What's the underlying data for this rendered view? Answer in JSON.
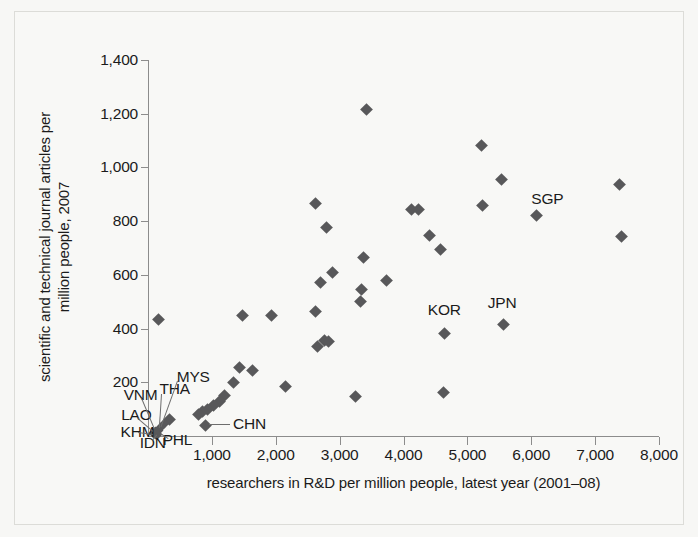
{
  "chart_data": {
    "type": "scatter",
    "title": "",
    "xlabel": "researchers in R&D per million people, latest year (2001–08)",
    "ylabel": "scientific and technical journal articles per million people, 2007",
    "xlim": [
      0,
      8000
    ],
    "ylim": [
      0,
      1400
    ],
    "xticks": [
      1000,
      2000,
      3000,
      4000,
      5000,
      6000,
      7000,
      8000
    ],
    "xticklabels": [
      "1,000",
      "2,000",
      "3,000",
      "4,000",
      "5,000",
      "6,000",
      "7,000",
      "8,000"
    ],
    "yticks": [
      200,
      400,
      600,
      800,
      1000,
      1200,
      1400
    ],
    "yticklabels": [
      "200",
      "400",
      "600",
      "800",
      "1,000",
      "1,200",
      "1,400"
    ],
    "grid": false,
    "legend": null,
    "marker": "diamond",
    "marker_color": "#58585a",
    "points": [
      {
        "x": 160,
        "y": 435,
        "label": ""
      },
      {
        "x": 1480,
        "y": 450,
        "label": ""
      },
      {
        "x": 1930,
        "y": 447,
        "label": ""
      },
      {
        "x": 2630,
        "y": 865,
        "label": ""
      },
      {
        "x": 2790,
        "y": 775,
        "label": ""
      },
      {
        "x": 2700,
        "y": 572,
        "label": ""
      },
      {
        "x": 2890,
        "y": 610,
        "label": ""
      },
      {
        "x": 3420,
        "y": 1215,
        "label": ""
      },
      {
        "x": 3380,
        "y": 665,
        "label": ""
      },
      {
        "x": 3340,
        "y": 545,
        "label": ""
      },
      {
        "x": 3320,
        "y": 500,
        "label": ""
      },
      {
        "x": 3730,
        "y": 580,
        "label": ""
      },
      {
        "x": 4130,
        "y": 845,
        "label": ""
      },
      {
        "x": 4240,
        "y": 845,
        "label": ""
      },
      {
        "x": 4400,
        "y": 748,
        "label": ""
      },
      {
        "x": 4580,
        "y": 695,
        "label": ""
      },
      {
        "x": 5220,
        "y": 1080,
        "label": ""
      },
      {
        "x": 5540,
        "y": 955,
        "label": ""
      },
      {
        "x": 5230,
        "y": 860,
        "label": ""
      },
      {
        "x": 6080,
        "y": 820,
        "label": "SGP"
      },
      {
        "x": 7380,
        "y": 935,
        "label": ""
      },
      {
        "x": 7420,
        "y": 742,
        "label": ""
      },
      {
        "x": 4640,
        "y": 380,
        "label": "KOR"
      },
      {
        "x": 5560,
        "y": 415,
        "label": "JPN"
      },
      {
        "x": 2660,
        "y": 335,
        "label": ""
      },
      {
        "x": 2760,
        "y": 355,
        "label": ""
      },
      {
        "x": 2820,
        "y": 352,
        "label": ""
      },
      {
        "x": 2620,
        "y": 465,
        "label": ""
      },
      {
        "x": 2150,
        "y": 185,
        "label": ""
      },
      {
        "x": 3250,
        "y": 148,
        "label": ""
      },
      {
        "x": 4630,
        "y": 163,
        "label": ""
      },
      {
        "x": 1430,
        "y": 255,
        "label": ""
      },
      {
        "x": 1640,
        "y": 245,
        "label": ""
      },
      {
        "x": 1340,
        "y": 200,
        "label": ""
      },
      {
        "x": 1200,
        "y": 150,
        "label": ""
      },
      {
        "x": 1120,
        "y": 130,
        "label": ""
      },
      {
        "x": 1020,
        "y": 112,
        "label": ""
      },
      {
        "x": 930,
        "y": 100,
        "label": ""
      },
      {
        "x": 860,
        "y": 90,
        "label": ""
      },
      {
        "x": 790,
        "y": 80,
        "label": ""
      },
      {
        "x": 900,
        "y": 40,
        "label": "CHN"
      },
      {
        "x": 330,
        "y": 62,
        "label": ""
      },
      {
        "x": 260,
        "y": 48,
        "label": ""
      },
      {
        "x": 200,
        "y": 30,
        "label": "MYS"
      },
      {
        "x": 160,
        "y": 22,
        "label": "THA"
      },
      {
        "x": 120,
        "y": 16,
        "label": "VNM"
      },
      {
        "x": 95,
        "y": 12,
        "label": "LAO"
      },
      {
        "x": 80,
        "y": 8,
        "label": "KHM"
      },
      {
        "x": 110,
        "y": 5,
        "label": "IDN"
      },
      {
        "x": 150,
        "y": 4,
        "label": "PHL"
      }
    ],
    "annotations": [
      {
        "text": "SGP",
        "x": 6000,
        "y": 880
      },
      {
        "text": "KOR",
        "x": 4380,
        "y": 465
      },
      {
        "text": "JPN",
        "x": 5320,
        "y": 490
      },
      {
        "text": "CHN",
        "x": 1330,
        "y": 40
      },
      {
        "text": "MYS",
        "x": 450,
        "y": 215
      },
      {
        "text": "THA",
        "x": 180,
        "y": 170
      },
      {
        "text": "VNM",
        "x": -380,
        "y": 150
      },
      {
        "text": "LAO",
        "x": -420,
        "y": 75
      },
      {
        "text": "KHM",
        "x": -430,
        "y": 10
      },
      {
        "text": "IDN",
        "x": -130,
        "y": -28
      },
      {
        "text": "PHL",
        "x": 230,
        "y": -20
      }
    ]
  },
  "axes": {
    "y_title": "scientific and technical journal articles per million people, 2007",
    "x_title": "researchers in R&D per million people, latest year (2001–08)",
    "y_ticks": [
      "1,400",
      "1,200",
      "1,000",
      "800",
      "600",
      "400",
      "200"
    ],
    "x_ticks": [
      "1,000",
      "2,000",
      "3,000",
      "4,000",
      "5,000",
      "6,000",
      "7,000",
      "8,000"
    ]
  },
  "colors": {
    "marker": "#58585a",
    "axis": "#8c8c8c",
    "text": "#1b1b1b",
    "background": "#f8f8f6"
  }
}
